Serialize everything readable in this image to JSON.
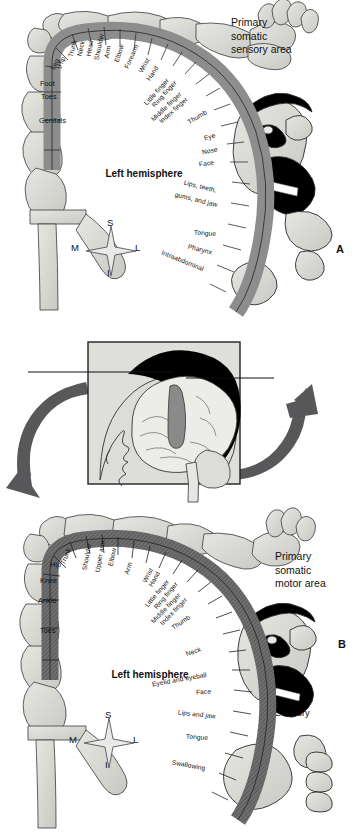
{
  "figure": {
    "panel_a_letter": "A",
    "panel_b_letter": "B",
    "hemisphere_label": "Left hemisphere"
  },
  "compass": {
    "superior": "S",
    "inferior": "I",
    "medial": "M",
    "lateral": "L"
  },
  "sensory_panel": {
    "title": "Primary somatic sensory area",
    "title_lines": [
      "Primary",
      "somatic",
      "sensory area"
    ],
    "hemisphere": "Left hemisphere",
    "labels": [
      "Genitals",
      "Toes",
      "Foot",
      "Leg",
      "Hip",
      "Trunk",
      "Neck",
      "Head",
      "Shoulder",
      "Arm",
      "Elbow",
      "Forearm",
      "Wrist",
      "Hand",
      "Little finger",
      "Ring finger",
      "Middle finger",
      "Index finger",
      "Thumb",
      "Eye",
      "Nose",
      "Face",
      "Lips, teeth, gums, and jaw",
      "Tongue",
      "Pharynx",
      "Intraabdominal"
    ]
  },
  "motor_panel": {
    "title": "Primary somatic motor area",
    "title_lines": [
      "Primary",
      "somatic",
      "motor area"
    ],
    "hemisphere": "Left hemisphere",
    "labels": [
      "Toes",
      "Ankle",
      "Knee",
      "Hip",
      "Trunk",
      "Shoulder",
      "Upper arm",
      "Elbow",
      "Arm",
      "Wrist",
      "Hand",
      "Little finger",
      "Ring finger",
      "Middle finger",
      "Index finger",
      "Thumb",
      "Neck",
      "Eyelid and eyeball",
      "Face",
      "Lips and jaw",
      "Tongue",
      "Swallowing"
    ]
  },
  "inset": {
    "motor_label": "Motor",
    "sensory_label": "Sensory"
  },
  "colors": {
    "band_sensory": "#8d8d8d",
    "band_motor": "#6f6f6f",
    "body_fill": "#d8d8d4",
    "arrow": "#58585a",
    "inset_bg": "#dededa",
    "hair": "#000000",
    "outline": "#2a2a2a"
  }
}
